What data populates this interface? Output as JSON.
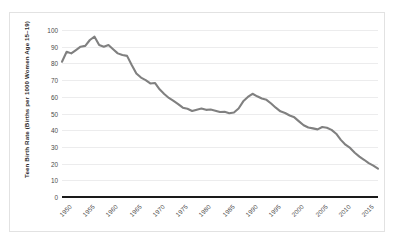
{
  "chart_data": {
    "type": "line",
    "title": "",
    "subtitle": "",
    "xlabel": "",
    "ylabel": "Teen Birth Rate (Births per 1000 Women Age 15–19)",
    "xlim": [
      1950,
      2018
    ],
    "ylim": [
      0,
      100
    ],
    "grid": true,
    "legend": "none",
    "line_color": "#808080",
    "axis_color": "#1a1a1a",
    "gridline_color": "#ececed",
    "ytick_labels": [
      "100",
      "90",
      "80",
      "70",
      "60",
      "50",
      "40",
      "30",
      "20",
      "10",
      "0"
    ],
    "ytick_values": [
      100,
      90,
      80,
      70,
      60,
      50,
      40,
      30,
      20,
      10,
      0
    ],
    "xtick_labels": [
      "1950",
      "1955",
      "1960",
      "1965",
      "1970",
      "1975",
      "1980",
      "1985",
      "1990",
      "1995",
      "2000",
      "2005",
      "2010",
      "2015"
    ],
    "xtick_values": [
      1950,
      1955,
      1960,
      1965,
      1970,
      1975,
      1980,
      1985,
      1990,
      1995,
      2000,
      2005,
      2010,
      2015
    ],
    "series": [
      {
        "name": "Teen Birth Rate",
        "x": [
          1950,
          1951,
          1952,
          1953,
          1954,
          1955,
          1956,
          1957,
          1958,
          1959,
          1960,
          1961,
          1962,
          1963,
          1964,
          1965,
          1966,
          1967,
          1968,
          1969,
          1970,
          1971,
          1972,
          1973,
          1974,
          1975,
          1976,
          1977,
          1978,
          1979,
          1980,
          1981,
          1982,
          1983,
          1984,
          1985,
          1986,
          1987,
          1988,
          1989,
          1990,
          1991,
          1992,
          1993,
          1994,
          1995,
          1996,
          1997,
          1998,
          1999,
          2000,
          2001,
          2002,
          2003,
          2004,
          2005,
          2006,
          2007,
          2008,
          2009,
          2010,
          2011,
          2012,
          2013,
          2014,
          2015,
          2016,
          2017,
          2018
        ],
        "values": [
          81.0,
          87.0,
          86.0,
          88.0,
          90.0,
          90.5,
          94.0,
          96.0,
          91.0,
          90.0,
          91.0,
          88.5,
          86.0,
          85.0,
          84.5,
          79.0,
          74.0,
          71.5,
          70.0,
          68.0,
          68.3,
          64.5,
          61.7,
          59.3,
          57.5,
          55.6,
          53.5,
          52.8,
          51.5,
          52.3,
          53.0,
          52.2,
          52.4,
          51.7,
          50.9,
          51.0,
          50.2,
          50.6,
          53.0,
          57.3,
          59.9,
          61.8,
          60.3,
          59.0,
          58.2,
          56.0,
          53.5,
          51.3,
          50.3,
          48.8,
          47.7,
          45.3,
          43.0,
          41.6,
          41.1,
          40.5,
          41.9,
          41.5,
          40.2,
          37.9,
          34.2,
          31.3,
          29.4,
          26.5,
          24.2,
          22.3,
          20.3,
          18.8,
          17.0
        ],
        "color": "#808080"
      }
    ]
  }
}
